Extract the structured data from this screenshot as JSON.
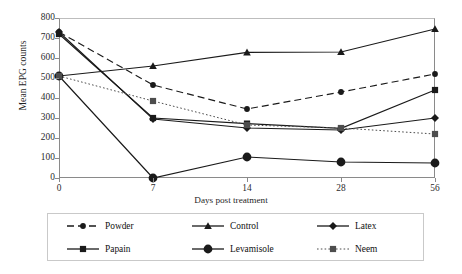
{
  "chart_data": {
    "type": "line",
    "title": "",
    "xlabel": "Days post treatment",
    "ylabel": "Mean EPG counts",
    "categories": [
      "0",
      "7",
      "14",
      "28",
      "56"
    ],
    "x": [
      0,
      7,
      14,
      28,
      56
    ],
    "ylim": [
      0,
      800
    ],
    "yticks": [
      0,
      100,
      200,
      300,
      400,
      500,
      600,
      700,
      800
    ],
    "xticks": [
      "0",
      "7",
      "14",
      "28",
      "56"
    ],
    "grid": false,
    "legend_position": "bottom",
    "series": [
      {
        "name": "Powder",
        "values": [
          730,
          465,
          345,
          430,
          520
        ],
        "marker": "circle",
        "line_style": "dashed",
        "color": "#1a1a1a"
      },
      {
        "name": "Control",
        "values": [
          510,
          560,
          628,
          630,
          745
        ],
        "marker": "triangle",
        "line_style": "solid",
        "color": "#1a1a1a"
      },
      {
        "name": "Latex",
        "values": [
          730,
          295,
          250,
          240,
          300
        ],
        "marker": "diamond",
        "line_style": "solid",
        "color": "#1a1a1a"
      },
      {
        "name": "Papain",
        "values": [
          720,
          300,
          272,
          248,
          440
        ],
        "marker": "square",
        "line_style": "solid",
        "color": "#1a1a1a"
      },
      {
        "name": "Levamisole",
        "values": [
          510,
          0,
          105,
          80,
          75
        ],
        "marker": "big-circle",
        "line_style": "solid",
        "color": "#1a1a1a"
      },
      {
        "name": "Neem",
        "values": [
          510,
          385,
          265,
          250,
          220
        ],
        "marker": "square",
        "line_style": "dotted",
        "color": "#4d4d4d"
      }
    ]
  },
  "axes": {
    "y_tick_labels": [
      "800",
      "700",
      "600",
      "500",
      "400",
      "300",
      "200",
      "100",
      "0"
    ],
    "x_tick_labels": [
      "0",
      "7",
      "14",
      "28",
      "56"
    ],
    "y_axis_title": "Mean EPG counts",
    "x_axis_title": "Days post treatment"
  },
  "legend": {
    "entries": [
      {
        "label": "Powder"
      },
      {
        "label": "Control"
      },
      {
        "label": "Latex"
      },
      {
        "label": "Papain"
      },
      {
        "label": "Levamisole"
      },
      {
        "label": "Neem"
      }
    ]
  }
}
